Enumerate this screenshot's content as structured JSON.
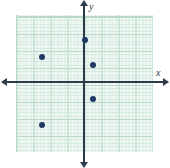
{
  "chart_data": {
    "type": "scatter",
    "title": "",
    "subtitle": "",
    "xlabel": "x",
    "ylabel": "y",
    "xlim": [
      -4,
      4
    ],
    "ylim": [
      -4,
      4
    ],
    "grid": true,
    "legend": null,
    "legend_position": "none",
    "x_major_step": 1,
    "y_major_step": 1,
    "x_minor_step": 0.2,
    "y_minor_step": 0.2,
    "tick_labels_shown": false,
    "x_tick_labels": [],
    "y_tick_labels": [],
    "point_color": "#1f3864",
    "axis_color": "#2d3a48",
    "grid_major_color": "#b9d9c9",
    "grid_minor_color": "#d7ebe0",
    "plot_background": "#f2f8f5",
    "series": [
      {
        "name": "points",
        "points": [
          {
            "x": -2.5,
            "y": 1.5
          },
          {
            "x": 0,
            "y": 2.5
          },
          {
            "x": 0.5,
            "y": 1
          },
          {
            "x": 0.5,
            "y": -1
          },
          {
            "x": -2.5,
            "y": -2.5
          }
        ]
      }
    ],
    "annotations": []
  },
  "axes": {
    "x_label": "x",
    "y_label": "y"
  }
}
